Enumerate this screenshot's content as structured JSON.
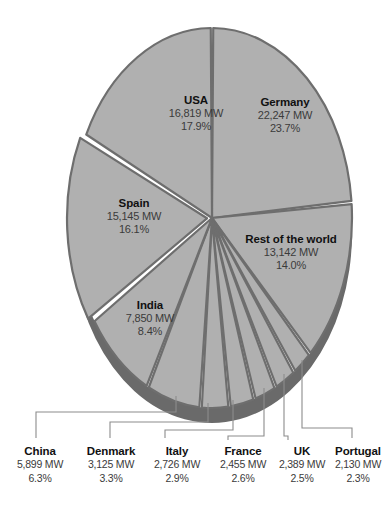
{
  "chart_data": {
    "type": "pie",
    "title": "",
    "subtitle": "",
    "unit": "MW",
    "legend_position": "none",
    "grid": false,
    "categories": [
      "Germany",
      "Rest of the world",
      "Portugal",
      "UK",
      "France",
      "Italy",
      "Denmark",
      "China",
      "India",
      "Spain",
      "USA"
    ],
    "values": [
      22247,
      13142,
      2130,
      2389,
      2455,
      2726,
      3125,
      5899,
      7850,
      15145,
      16819
    ],
    "percents": [
      23.7,
      14.0,
      2.3,
      2.5,
      2.6,
      2.9,
      3.3,
      6.3,
      8.4,
      16.1,
      17.9
    ],
    "slices": [
      {
        "name": "Germany",
        "value": "22,247 MW",
        "percent": "23.7%",
        "label_style": "inside"
      },
      {
        "name": "Rest of the world",
        "value": "13,142 MW",
        "percent": "14.0%",
        "label_style": "inside"
      },
      {
        "name": "Portugal",
        "value": "2,130 MW",
        "percent": "2.3%",
        "label_style": "callout"
      },
      {
        "name": "UK",
        "value": "2,389 MW",
        "percent": "2.5%",
        "label_style": "callout"
      },
      {
        "name": "France",
        "value": "2,455 MW",
        "percent": "2.6%",
        "label_style": "callout"
      },
      {
        "name": "Italy",
        "value": "2,726 MW",
        "percent": "2.9%",
        "label_style": "callout"
      },
      {
        "name": "Denmark",
        "value": "3,125 MW",
        "percent": "3.3%",
        "label_style": "callout"
      },
      {
        "name": "China",
        "value": "5,899 MW",
        "percent": "6.3%",
        "label_style": "callout"
      },
      {
        "name": "India",
        "value": "7,850 MW",
        "percent": "8.4%",
        "label_style": "inside"
      },
      {
        "name": "Spain",
        "value": "15,145 MW",
        "percent": "16.1%",
        "label_style": "inside"
      },
      {
        "name": "USA",
        "value": "16,819 MW",
        "percent": "17.9%",
        "label_style": "inside"
      }
    ]
  },
  "colors": {
    "background": "#ffffff",
    "slice_face": "#b0b0b0",
    "slice_face_alt": "#b4b4b4",
    "slice_edge": "#6e6e6e",
    "rim_dark": "#6a6a6a",
    "leader_line": "#8c8c8c",
    "label_name": "#111111",
    "label_value": "#3b3b3b"
  },
  "labels": {
    "inside": [
      {
        "key": "usa",
        "name": "USA",
        "value": "16,819 MW",
        "percent": "17.9%"
      },
      {
        "key": "germany",
        "name": "Germany",
        "value": "22,247 MW",
        "percent": "23.7%"
      },
      {
        "key": "spain",
        "name": "Spain",
        "value": "15,145 MW",
        "percent": "16.1%"
      },
      {
        "key": "rest",
        "name": "Rest of the world",
        "value": "13,142 MW",
        "percent": "14.0%"
      },
      {
        "key": "india",
        "name": "India",
        "value": "7,850 MW",
        "percent": "8.4%"
      }
    ],
    "callouts": [
      {
        "key": "china",
        "name": "China",
        "value": "5,899 MW",
        "percent": "6.3%"
      },
      {
        "key": "denmark",
        "name": "Denmark",
        "value": "3,125 MW",
        "percent": "3.3%"
      },
      {
        "key": "italy",
        "name": "Italy",
        "value": "2,726 MW",
        "percent": "2.9%"
      },
      {
        "key": "france",
        "name": "France",
        "value": "2,455 MW",
        "percent": "2.6%"
      },
      {
        "key": "uk",
        "name": "UK",
        "value": "2,389 MW",
        "percent": "2.5%"
      },
      {
        "key": "portugal",
        "name": "Portugal",
        "value": "2,130 MW",
        "percent": "2.3%"
      }
    ]
  }
}
